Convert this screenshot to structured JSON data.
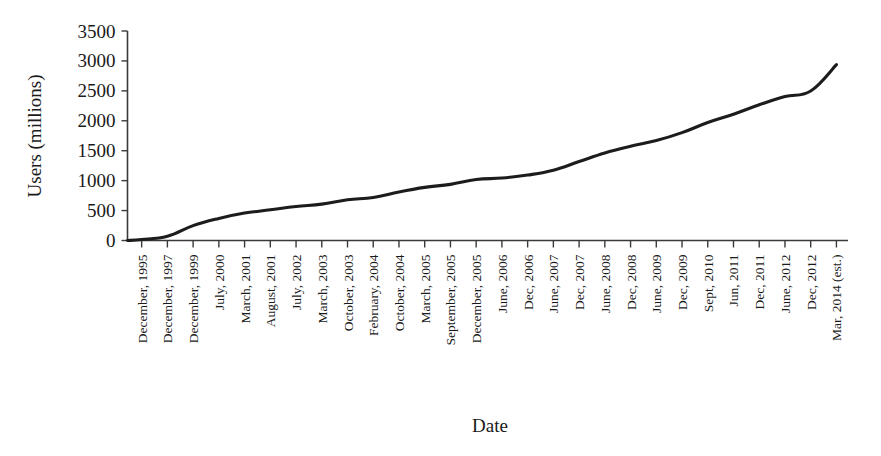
{
  "chart_data": {
    "type": "line",
    "title": "",
    "xlabel": "Date",
    "ylabel": "Users (millions)",
    "ylim": [
      0,
      3500
    ],
    "ytick_values": [
      0,
      500,
      1000,
      1500,
      2000,
      2500,
      3000,
      3500
    ],
    "ytick_labels": [
      "0",
      "500",
      "1000",
      "1500",
      "2000",
      "2500",
      "3000",
      "3500"
    ],
    "grid": false,
    "legend": null,
    "legend_position": "none",
    "categories": [
      "December, 1995",
      "December, 1997",
      "December, 1999",
      "July, 2000",
      "March, 2001",
      "August, 2001",
      "July, 2002",
      "March, 2003",
      "October, 2003",
      "February, 2004",
      "October, 2004",
      "March, 2005",
      "September, 2005",
      "December, 2005",
      "June, 2006",
      "Dec, 2006",
      "June, 2007",
      "Dec, 2007",
      "June, 2008",
      "Dec, 2008",
      "June, 2009",
      "Dec, 2009",
      "Sept, 2010",
      "Jun, 2011",
      "Dec, 2011",
      "June, 2012",
      "Dec, 2012",
      "Mar, 2014 (est.)"
    ],
    "values": [
      16,
      70,
      248,
      368,
      458,
      513,
      569,
      608,
      682,
      719,
      812,
      888,
      938,
      1018,
      1043,
      1093,
      1173,
      1319,
      1463,
      1574,
      1669,
      1802,
      1971,
      2110,
      2267,
      2405,
      2497,
      2937
    ],
    "series_name": "Internet users worldwide",
    "line_color": "#1c1c1c"
  },
  "axis": {
    "ylabel": "Users (millions)",
    "xlabel": "Date"
  }
}
